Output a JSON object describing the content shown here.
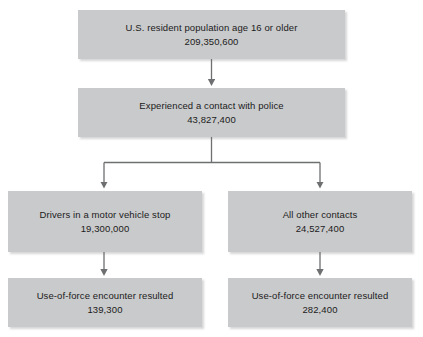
{
  "diagram": {
    "type": "flowchart",
    "orientation": "top-down",
    "accent_color": "#c9cacb",
    "line_color": "#6e6f70",
    "text_color": "#1b1b1b",
    "background": "#ffffff",
    "nodes": [
      {
        "id": "population",
        "label": "U.S. resident population age 16 or older",
        "value": "209,350,600"
      },
      {
        "id": "contact",
        "label": "Experienced a contact with police",
        "value": "43,827,400"
      },
      {
        "id": "vehicle_stop",
        "label": "Drivers in a motor vehicle stop",
        "value": "19,300,000"
      },
      {
        "id": "other_contacts",
        "label": "All other contacts",
        "value": "24,527,400"
      },
      {
        "id": "force_left",
        "label": "Use-of-force encounter resulted",
        "value": "139,300"
      },
      {
        "id": "force_right",
        "label": "Use-of-force encounter resulted",
        "value": "282,400"
      }
    ],
    "edges": [
      {
        "id": "population-to-contact",
        "from": "population",
        "to": "contact",
        "style": "arrow-down"
      },
      {
        "id": "contact-to-vehicle-stop",
        "from": "contact",
        "to": "vehicle_stop",
        "style": "elbow-arrow-down"
      },
      {
        "id": "contact-to-other-contacts",
        "from": "contact",
        "to": "other_contacts",
        "style": "elbow-arrow-down"
      },
      {
        "id": "vehicle-stop-to-force-left",
        "from": "vehicle_stop",
        "to": "force_left",
        "style": "arrow-down"
      },
      {
        "id": "other-contacts-to-force-right",
        "from": "other_contacts",
        "to": "force_right",
        "style": "arrow-down"
      }
    ]
  }
}
